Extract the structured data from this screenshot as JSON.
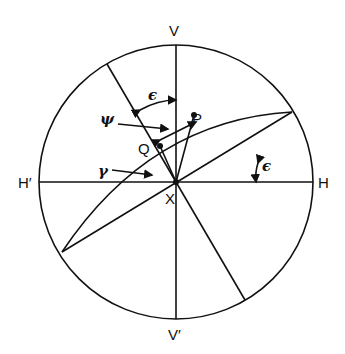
{
  "labels": {
    "V": "V",
    "V2": "V′",
    "H": "H",
    "H2": "H′",
    "P": "P",
    "Q": "Q",
    "X": "X",
    "psi": "ψ",
    "gamma": "γ",
    "eps1": "ϵ",
    "eps2": "ϵ"
  }
}
